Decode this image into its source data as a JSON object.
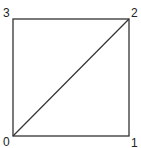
{
  "diagram": {
    "type": "square-with-diagonal",
    "vertices": [
      {
        "id": "0",
        "label": "0",
        "x": 13,
        "y": 136
      },
      {
        "id": "1",
        "label": "1",
        "x": 129,
        "y": 136
      },
      {
        "id": "2",
        "label": "2",
        "x": 129,
        "y": 19
      },
      {
        "id": "3",
        "label": "3",
        "x": 13,
        "y": 19
      }
    ],
    "edges": [
      [
        "0",
        "1"
      ],
      [
        "1",
        "2"
      ],
      [
        "2",
        "3"
      ],
      [
        "3",
        "0"
      ],
      [
        "0",
        "2"
      ]
    ],
    "stroke_color": "#333333",
    "background": "#ffffff"
  }
}
